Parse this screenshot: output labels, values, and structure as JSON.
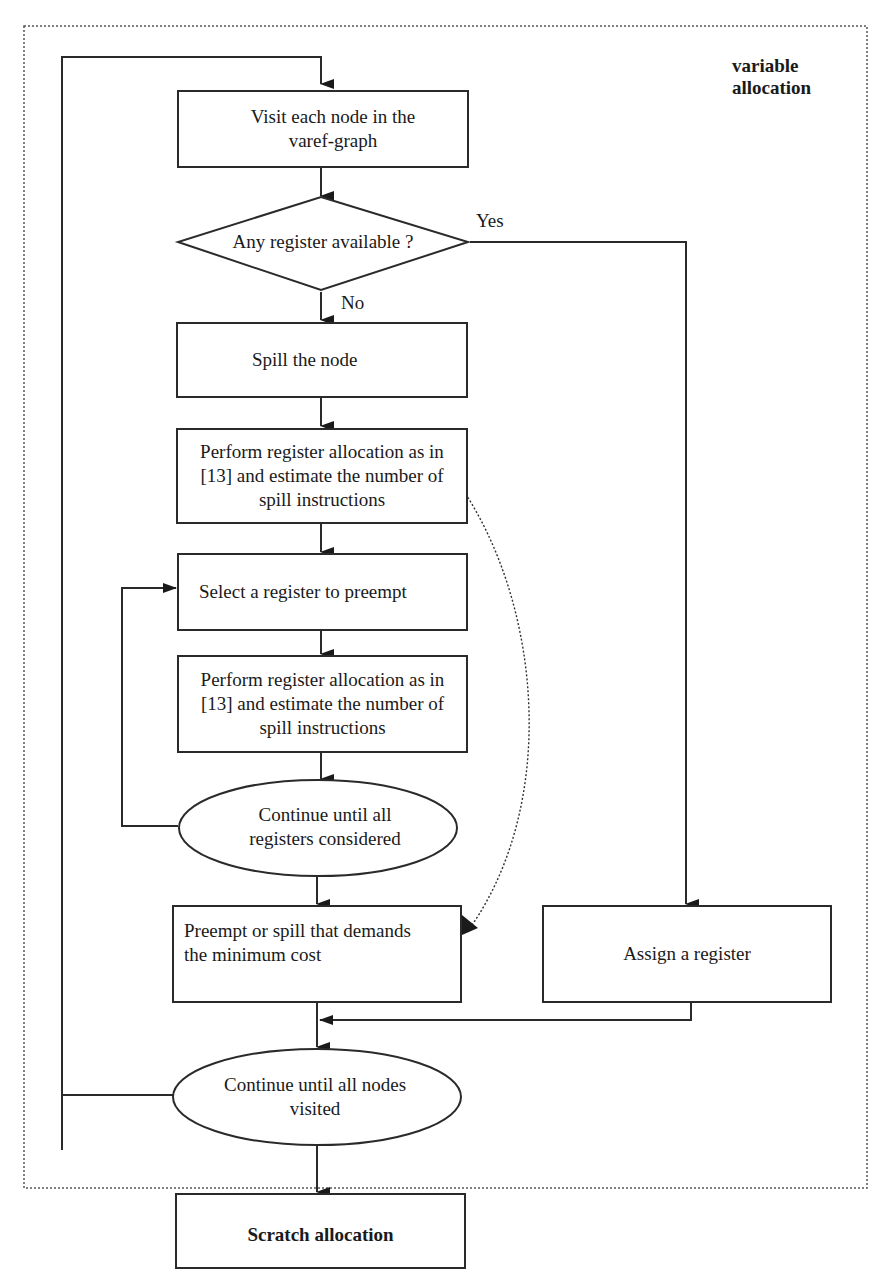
{
  "region_title": "variable allocation",
  "nodes": {
    "visit": "Visit each node in the varef-graph",
    "decision": "Any register available ?",
    "spill": "Spill the node",
    "perform1": "Perform register allocation as in [13] and estimate the number of spill instructions",
    "select": "Select a register to preempt",
    "perform2": "Perform register allocation as in [13] and estimate the number of spill instructions",
    "continue_regs": "Continue until all registers considered",
    "preempt": "Preempt or spill that demands the minimum cost",
    "assign": "Assign a register",
    "continue_nodes": "Continue until all nodes visited",
    "scratch": "Scratch allocation"
  },
  "edge_labels": {
    "yes": "Yes",
    "no": "No"
  },
  "colors": {
    "line": "#2a2a2a",
    "dotted_border": "#555555"
  }
}
